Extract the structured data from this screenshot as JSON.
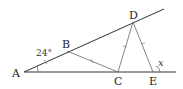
{
  "diagram": {
    "points": {
      "A": {
        "label": "A",
        "x": 24,
        "y": 72
      },
      "B": {
        "label": "B",
        "x": 67,
        "y": 51
      },
      "C": {
        "label": "C",
        "x": 118,
        "y": 72
      },
      "D": {
        "label": "D",
        "x": 133,
        "y": 22
      },
      "E": {
        "label": "E",
        "x": 153,
        "y": 72
      }
    },
    "angle_label": "24°",
    "unknown_label": "x",
    "segments": [
      "AD (ray)",
      "AE (ray)",
      "BC",
      "CD",
      "DE"
    ],
    "equal_marks": [
      "AB",
      "BC",
      "CD",
      "DE"
    ]
  }
}
